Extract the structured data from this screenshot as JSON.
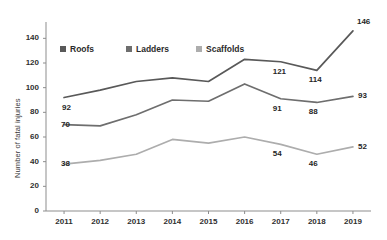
{
  "chart_data": {
    "type": "line",
    "title": "",
    "xlabel": "",
    "ylabel": "Number of fatal injuries",
    "categories": [
      "2011",
      "2012",
      "2013",
      "2014",
      "2015",
      "2016",
      "2017",
      "2018",
      "2019"
    ],
    "ylim": [
      0,
      150
    ],
    "yticks": [
      0,
      20,
      40,
      60,
      80,
      100,
      120,
      140
    ],
    "grid": false,
    "legend_position": "top-left-inside",
    "series": [
      {
        "name": "Roofs",
        "color": "#595959",
        "values": [
          92,
          98,
          105,
          108,
          105,
          123,
          121,
          114,
          146
        ],
        "labels": [
          {
            "category": "2011",
            "value": 92,
            "text": "92",
            "anchor": "below-left"
          },
          {
            "category": "2017",
            "value": 121,
            "text": "121",
            "anchor": "below"
          },
          {
            "category": "2018",
            "value": 114,
            "text": "114",
            "anchor": "below"
          },
          {
            "category": "2019",
            "value": 146,
            "text": "146",
            "anchor": "above-right"
          }
        ]
      },
      {
        "name": "Ladders",
        "color": "#6e6e6e",
        "values": [
          70,
          69,
          78,
          90,
          89,
          103,
          91,
          88,
          93
        ],
        "labels": [
          {
            "category": "2011",
            "value": 70,
            "text": "70",
            "anchor": "left"
          },
          {
            "category": "2017",
            "value": 91,
            "text": "91",
            "anchor": "below"
          },
          {
            "category": "2018",
            "value": 88,
            "text": "88",
            "anchor": "below"
          },
          {
            "category": "2019",
            "value": 93,
            "text": "93",
            "anchor": "right"
          }
        ]
      },
      {
        "name": "Scaffolds",
        "color": "#adadad",
        "values": [
          38,
          41,
          46,
          58,
          55,
          60,
          54,
          46,
          52
        ],
        "labels": [
          {
            "category": "2011",
            "value": 38,
            "text": "38",
            "anchor": "left"
          },
          {
            "category": "2017",
            "value": 54,
            "text": "54",
            "anchor": "below"
          },
          {
            "category": "2018",
            "value": 46,
            "text": "46",
            "anchor": "below"
          },
          {
            "category": "2019",
            "value": 52,
            "text": "52",
            "anchor": "right"
          }
        ]
      }
    ]
  },
  "legend": {
    "items": [
      {
        "label": "Roofs",
        "color": "#595959"
      },
      {
        "label": "Ladders",
        "color": "#6e6e6e"
      },
      {
        "label": "Scaffolds",
        "color": "#adadad"
      }
    ]
  },
  "axes": {
    "y_title": "Number of fatal injuries",
    "y_tick_labels": [
      "0",
      "20",
      "40",
      "60",
      "80",
      "100",
      "120",
      "140"
    ],
    "x_tick_labels": [
      "2011",
      "2012",
      "2013",
      "2014",
      "2015",
      "2016",
      "2017",
      "2018",
      "2019"
    ]
  },
  "caption": {
    "fragment": ""
  }
}
